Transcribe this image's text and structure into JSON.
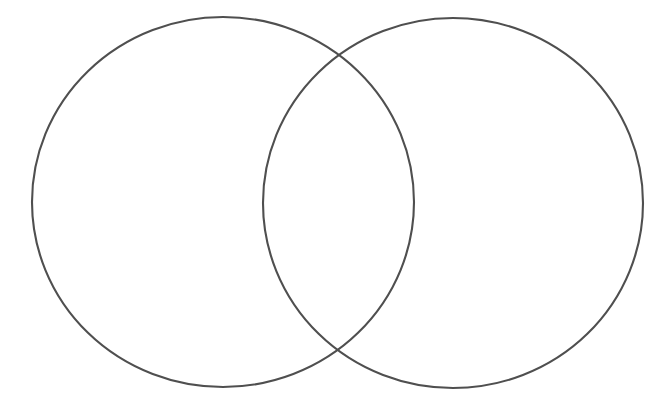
{
  "page": {
    "width": 662,
    "height": 420,
    "background_color": "#ffffff",
    "content_type": "blank two-set venn diagram template",
    "visible_text": ""
  },
  "diagram": {
    "kind": "venn",
    "set_count": 2,
    "stroke_color": "#4f4f4f",
    "stroke_width": 2.1,
    "fill_color": "none",
    "left_circle": {
      "name": "left-set",
      "label": "",
      "cx": 223,
      "cy": 202,
      "rx": 191,
      "ry": 185
    },
    "right_circle": {
      "name": "right-set",
      "label": "",
      "cx": 453,
      "cy": 203,
      "rx": 190,
      "ry": 185
    },
    "regions": [
      {
        "name": "left-only",
        "label": ""
      },
      {
        "name": "intersection",
        "label": ""
      },
      {
        "name": "right-only",
        "label": ""
      }
    ],
    "intersection_points": [
      {
        "x": 338,
        "y": 55
      },
      {
        "x": 340,
        "y": 353
      }
    ]
  },
  "chart_data": {
    "type": "venn",
    "title": "",
    "sets": [
      {
        "name": "left-set",
        "label": "",
        "items": [],
        "count": 0
      },
      {
        "name": "right-set",
        "label": "",
        "items": [],
        "count": 0
      }
    ],
    "overlap": {
      "label": "",
      "items": [],
      "count": 0
    },
    "annotations": [],
    "legend": []
  }
}
